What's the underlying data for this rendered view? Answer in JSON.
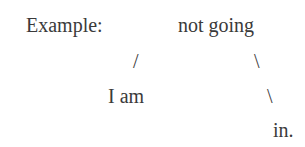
{
  "example": {
    "label": "Example:",
    "tree": {
      "root": "not going",
      "left_branch": "/",
      "left_child": "I am",
      "right_branch_1": "\\",
      "right_branch_2": "\\",
      "right_child": "in."
    }
  }
}
